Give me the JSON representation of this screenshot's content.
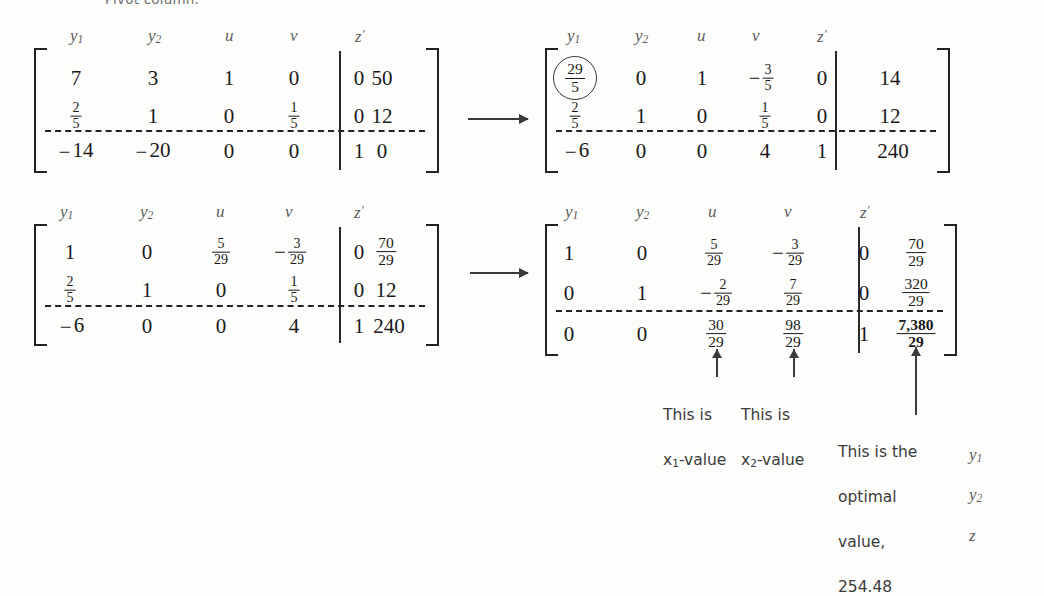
{
  "page": {
    "caption_above": "Pivot column.",
    "background": "#fdfdfc",
    "ink": "#1a1a1a"
  },
  "column_headers": [
    "y1",
    "y2",
    "u",
    "v",
    "z'"
  ],
  "tableaux": [
    {
      "id": "tableau-1",
      "position": "top-left",
      "columns": [
        "y1",
        "y2",
        "u",
        "v",
        "z'"
      ],
      "rows": [
        {
          "cells": [
            "7",
            "3",
            "1",
            "0",
            "0"
          ],
          "rhs": "50"
        },
        {
          "cells": [
            "2/5",
            "1",
            "0",
            "1/5",
            "0"
          ],
          "rhs": "12"
        },
        {
          "cells": [
            "-14",
            "-20",
            "0",
            "0",
            "1"
          ],
          "rhs": "0",
          "objective": true
        }
      ],
      "pivot_circled": null,
      "row_labels": []
    },
    {
      "id": "tableau-2",
      "position": "top-right",
      "columns": [
        "y1",
        "y2",
        "u",
        "v",
        "z'"
      ],
      "rows": [
        {
          "cells": [
            "29/5",
            "0",
            "1",
            "-3/5",
            "0"
          ],
          "rhs": "14"
        },
        {
          "cells": [
            "2/5",
            "1",
            "0",
            "1/5",
            "0"
          ],
          "rhs": "12"
        },
        {
          "cells": [
            "-6",
            "0",
            "0",
            "4",
            "1"
          ],
          "rhs": "240",
          "objective": true
        }
      ],
      "pivot_circled": {
        "row": 0,
        "col": 0,
        "value": "29/5"
      },
      "row_labels": []
    },
    {
      "id": "tableau-3",
      "position": "bottom-left",
      "columns": [
        "y1",
        "y2",
        "u",
        "v",
        "z'"
      ],
      "rows": [
        {
          "cells": [
            "1",
            "0",
            "5/29",
            "-3/29",
            "0"
          ],
          "rhs": "70/29"
        },
        {
          "cells": [
            "2/5",
            "1",
            "0",
            "1/5",
            "0"
          ],
          "rhs": "12"
        },
        {
          "cells": [
            "-6",
            "0",
            "0",
            "4",
            "1"
          ],
          "rhs": "240",
          "objective": true
        }
      ],
      "pivot_circled": null,
      "row_labels": []
    },
    {
      "id": "tableau-4",
      "position": "bottom-right",
      "columns": [
        "y1",
        "y2",
        "u",
        "v",
        "z'"
      ],
      "rows": [
        {
          "cells": [
            "1",
            "0",
            "5/29",
            "-3/29",
            "0"
          ],
          "rhs": "70/29",
          "label": "y1"
        },
        {
          "cells": [
            "0",
            "1",
            "-2/29",
            "7/29",
            "0"
          ],
          "rhs": "320/29",
          "label": "y2"
        },
        {
          "cells": [
            "0",
            "0",
            "30/29",
            "98/29",
            "1"
          ],
          "rhs": "7,380/29",
          "objective": true,
          "label": "z"
        }
      ],
      "pivot_circled": null,
      "row_labels": [
        "y1",
        "y2",
        "z"
      ]
    }
  ],
  "transform_arrows": [
    {
      "id": "arrow-top",
      "from": "tableau-1",
      "to": "tableau-2"
    },
    {
      "id": "arrow-bottom",
      "from": "tableau-3",
      "to": "tableau-4"
    }
  ],
  "annotations": [
    {
      "id": "annot-x1",
      "text": "This is\nx1-value",
      "line1": "This is",
      "line2_pre": "x",
      "line2_sub": "1",
      "line2_post": "-value",
      "points_to": "u-column"
    },
    {
      "id": "annot-x2",
      "text": "This is\nx2-value",
      "line1": "This is",
      "line2_pre": "x",
      "line2_sub": "2",
      "line2_post": "-value",
      "points_to": "v-column"
    },
    {
      "id": "annot-optimal",
      "lines": [
        "This is the",
        "optimal",
        "value,",
        "254.48"
      ],
      "points_to": "objective-rhs"
    }
  ]
}
